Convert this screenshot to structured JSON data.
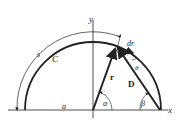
{
  "diagram": {
    "labels": {
      "y_axis": "y",
      "x_axis": "x",
      "arc_length": "s",
      "curve": "C",
      "radius_segment": "a",
      "position_vector": "r",
      "differential": "dr",
      "chord": "D",
      "angle_alpha": "α",
      "angle_beta": "β",
      "angle_theta": "θ"
    },
    "colors": {
      "stroke": "#222222"
    }
  }
}
